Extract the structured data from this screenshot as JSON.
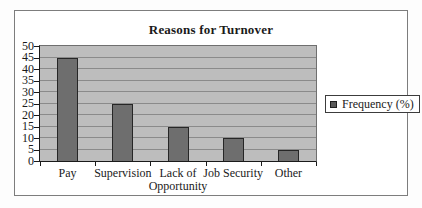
{
  "chart": {
    "title": "Reasons for Turnover",
    "legend": {
      "label": "Frequency (%)",
      "marker_color": "#5a5a5a"
    },
    "colors": {
      "plot_background": "#bdbdbd",
      "bar_fill": "#6e6e6e",
      "bar_border": "#262626",
      "gridline": "#8a8a8a",
      "axis": "#1a1a1a",
      "frame_border": "#7d7d7d"
    }
  },
  "chart_data": {
    "type": "bar",
    "title": "Reasons for Turnover",
    "categories": [
      "Pay",
      "Supervision",
      "Lack of Opportunity",
      "Job Security",
      "Other"
    ],
    "values": [
      45,
      25,
      15,
      10,
      5
    ],
    "series": [
      {
        "name": "Frequency (%)",
        "values": [
          45,
          25,
          15,
          10,
          5
        ]
      }
    ],
    "xlabel": "",
    "ylabel": "",
    "ylim": [
      0,
      50
    ],
    "ytick_step": 5,
    "ytick_labels": [
      "0",
      "5",
      "10",
      "15",
      "20",
      "25",
      "30",
      "35",
      "40",
      "45",
      "50"
    ],
    "grid": true,
    "legend_position": "right",
    "legend_entries": [
      "Frequency (%)"
    ]
  }
}
